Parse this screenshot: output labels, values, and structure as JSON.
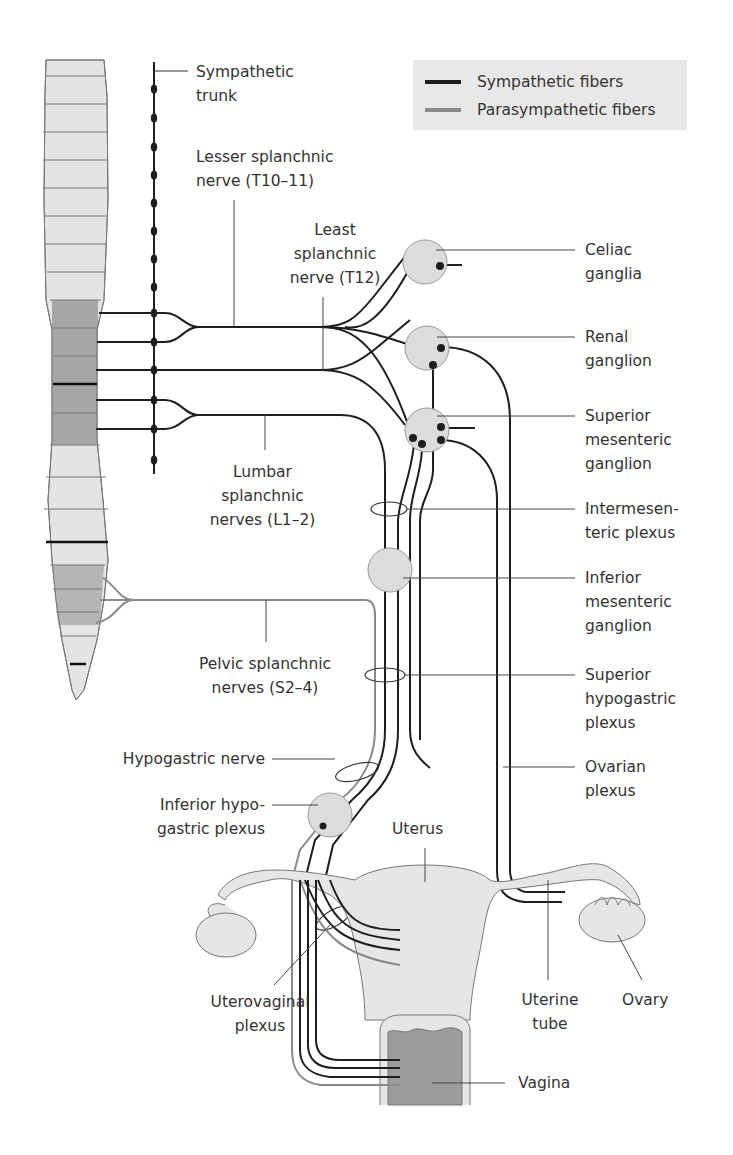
{
  "legend": {
    "items": [
      {
        "label": "Sympathetic fibers",
        "color": "#1e1e1e"
      },
      {
        "label": "Parasympathetic fibers",
        "color": "#8a8a8a"
      }
    ]
  },
  "labels": {
    "sympathetic_trunk": [
      "Sympathetic",
      "trunk"
    ],
    "lesser_splanchnic": [
      "Lesser splanchnic",
      "nerve (T10–11)"
    ],
    "least_splanchnic": [
      "Least",
      "splanchnic",
      "nerve (T12)"
    ],
    "lumbar_splanchnic": [
      "Lumbar",
      "splanchnic",
      "nerves (L1–2)"
    ],
    "pelvic_splanchnic": [
      "Pelvic splanchnic",
      "nerves (S2–4)"
    ],
    "celiac_ganglia": [
      "Celiac",
      "ganglia"
    ],
    "renal_ganglion": [
      "Renal",
      "ganglion"
    ],
    "superior_mesenteric_ganglion": [
      "Superior",
      "mesenteric",
      "ganglion"
    ],
    "intermesenteric_plexus": [
      "Intermesen-",
      "teric plexus"
    ],
    "inferior_mesenteric_ganglion": [
      "Inferior",
      "mesenteric",
      "ganglion"
    ],
    "superior_hypogastric_plexus": [
      "Superior",
      "hypogastric",
      "plexus"
    ],
    "ovarian_plexus": [
      "Ovarian",
      "plexus"
    ],
    "hypogastric_nerve": [
      "Hypogastric nerve"
    ],
    "inferior_hypogastric_plexus": [
      "Inferior hypo-",
      "gastric plexus"
    ],
    "uterus": [
      "Uterus"
    ],
    "uterovaginal_plexus": [
      "Uterovaginal",
      "plexus"
    ],
    "uterine_tube": [
      "Uterine",
      "tube"
    ],
    "ovary": [
      "Ovary"
    ],
    "vagina": [
      "Vagina"
    ]
  },
  "colors": {
    "sympathetic": "#1e1e1e",
    "parasympathetic": "#8a8a8a",
    "organ_fill": "#e6e6e6",
    "ganglion_fill": "#dcdcdc",
    "spinal_light": "#e4e4e4",
    "spinal_dark": "#a6a6a6",
    "spinal_mid": "#bdbdbd",
    "vagina_fill": "#9c9c9c"
  }
}
